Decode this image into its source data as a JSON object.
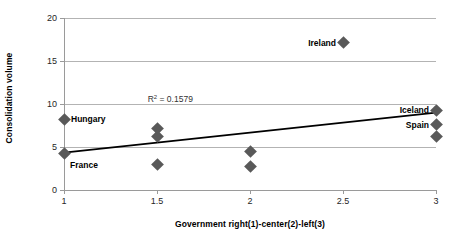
{
  "chart_data": {
    "type": "scatter",
    "title": "",
    "xlabel": "Government right(1)-center(2)-left(3)",
    "ylabel": "Consolidation volume",
    "xlim": [
      1,
      3
    ],
    "ylim": [
      0,
      20
    ],
    "xticks": [
      "1",
      "1.5",
      "2",
      "2.5",
      "3"
    ],
    "xtick_values": [
      1,
      1.5,
      2,
      2.5,
      3
    ],
    "yticks": [
      "0",
      "5",
      "10",
      "15",
      "20"
    ],
    "ytick_values": [
      0,
      5,
      10,
      15,
      20
    ],
    "grid": "horizontal",
    "legend": "none",
    "marker_shape": "diamond",
    "marker_color": "#595959",
    "points": [
      {
        "x": 1,
        "y": 8.2,
        "label": "Hungary",
        "label_side": "right"
      },
      {
        "x": 1,
        "y": 4.2,
        "label": "France",
        "label_side": "below-right"
      },
      {
        "x": 1.5,
        "y": 7.2,
        "label": ""
      },
      {
        "x": 1.5,
        "y": 6.2,
        "label": ""
      },
      {
        "x": 1.5,
        "y": 3.0,
        "label": ""
      },
      {
        "x": 2,
        "y": 4.5,
        "label": ""
      },
      {
        "x": 2,
        "y": 2.7,
        "label": ""
      },
      {
        "x": 2.5,
        "y": 17.1,
        "label": "Ireland",
        "label_side": "left"
      },
      {
        "x": 3,
        "y": 9.3,
        "label": "Iceland",
        "label_side": "left"
      },
      {
        "x": 3,
        "y": 7.6,
        "label": "Spain",
        "label_side": "left"
      },
      {
        "x": 3,
        "y": 6.2,
        "label": ""
      }
    ],
    "trendline": {
      "type": "linear",
      "x_start": 1,
      "y_start": 4.35,
      "x_end": 3,
      "y_end": 9.0,
      "color": "#000000",
      "width": 1.6
    },
    "annotations": [
      {
        "text_prefix": "R",
        "text_sup": "2",
        "text_suffix": " = 0.1579",
        "x": 1.45,
        "y": 10.6
      }
    ],
    "r_squared": 0.1579,
    "axis_color": "#9a9a9a",
    "gridline_color": "#b3b3b3"
  }
}
